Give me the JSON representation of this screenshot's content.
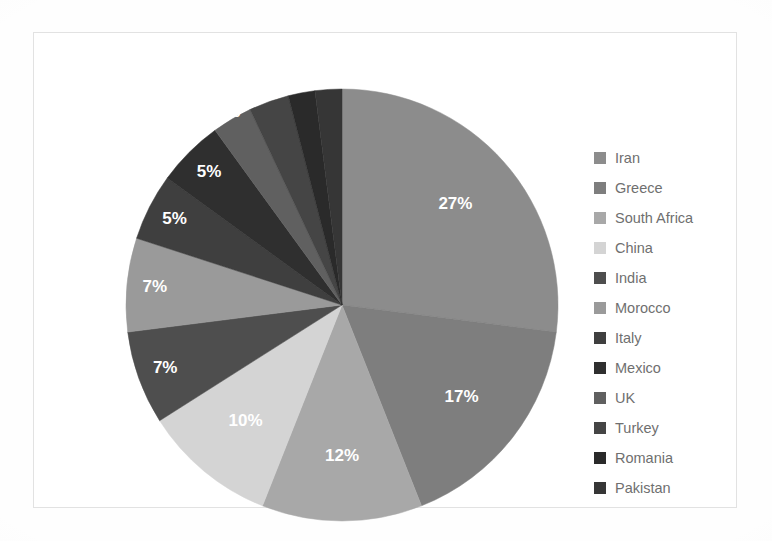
{
  "chart_data": {
    "type": "pie",
    "title": "",
    "subtitle": "",
    "xlabel": "",
    "ylabel": "",
    "grid": false,
    "legend_position": "right",
    "label_format": "percent",
    "start_angle_deg": 0,
    "direction": "clockwise",
    "categories": [
      "Iran",
      "Greece",
      "South Africa",
      "China",
      "India",
      "Morocco",
      "Italy",
      "Mexico",
      "UK",
      "Turkey",
      "Romania",
      "Pakistan"
    ],
    "values": [
      27,
      17,
      12,
      10,
      7,
      7,
      5,
      5,
      3,
      3,
      2,
      2
    ],
    "value_labels": [
      "27%",
      "17%",
      "12%",
      "10%",
      "7%",
      "7%",
      "5%",
      "5%",
      "3%",
      "3%",
      "2%",
      "2%"
    ],
    "colors": [
      "#8c8c8c",
      "#7e7e7e",
      "#a8a8a8",
      "#d4d4d4",
      "#4e4e4e",
      "#9a9a9a",
      "#3f3f3f",
      "#2f2f2f",
      "#606060",
      "#454545",
      "#2a2a2a",
      "#363636"
    ],
    "slices": [
      {
        "label": "Iran",
        "value": 27,
        "value_label": "27%",
        "color": "#8c8c8c"
      },
      {
        "label": "Greece",
        "value": 17,
        "value_label": "17%",
        "color": "#7e7e7e"
      },
      {
        "label": "South Africa",
        "value": 12,
        "value_label": "12%",
        "color": "#a8a8a8"
      },
      {
        "label": "China",
        "value": 10,
        "value_label": "10%",
        "color": "#d4d4d4"
      },
      {
        "label": "India",
        "value": 7,
        "value_label": "7%",
        "color": "#4e4e4e"
      },
      {
        "label": "Morocco",
        "value": 7,
        "value_label": "7%",
        "color": "#9a9a9a"
      },
      {
        "label": "Italy",
        "value": 5,
        "value_label": "5%",
        "color": "#3f3f3f"
      },
      {
        "label": "Mexico",
        "value": 5,
        "value_label": "5%",
        "color": "#2f2f2f"
      },
      {
        "label": "UK",
        "value": 3,
        "value_label": "3%",
        "color": "#606060"
      },
      {
        "label": "Turkey",
        "value": 3,
        "value_label": "3%",
        "color": "#454545"
      },
      {
        "label": "Romania",
        "value": 2,
        "value_label": "2%",
        "color": "#2a2a2a"
      },
      {
        "label": "Pakistan",
        "value": 2,
        "value_label": "2%",
        "color": "#363636"
      }
    ]
  },
  "legend": {
    "items": [
      {
        "label": "Iran",
        "color": "#8c8c8c"
      },
      {
        "label": "Greece",
        "color": "#7e7e7e"
      },
      {
        "label": "South Africa",
        "color": "#a8a8a8"
      },
      {
        "label": "China",
        "color": "#d4d4d4"
      },
      {
        "label": "India",
        "color": "#4e4e4e"
      },
      {
        "label": "Morocco",
        "color": "#9a9a9a"
      },
      {
        "label": "Italy",
        "color": "#3f3f3f"
      },
      {
        "label": "Mexico",
        "color": "#2f2f2f"
      },
      {
        "label": "UK",
        "color": "#606060"
      },
      {
        "label": "Turkey",
        "color": "#454545"
      },
      {
        "label": "Romania",
        "color": "#2a2a2a"
      },
      {
        "label": "Pakistan",
        "color": "#363636"
      }
    ]
  },
  "style": {
    "frame_color": "#e2e2e2",
    "background": "#ffffff",
    "label_text_color": "#ffffff",
    "legend_text_color": "#6f6f6f"
  }
}
